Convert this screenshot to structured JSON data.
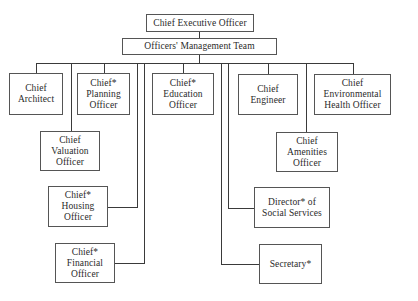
{
  "chart": {
    "top": {
      "ceo": [
        "Chief Executive Officer"
      ],
      "omt": [
        "Officers' Management Team"
      ]
    },
    "nodes": {
      "architect": [
        "Chief",
        "Architect"
      ],
      "planning": [
        "Chief*",
        "Planning",
        "Officer"
      ],
      "education": [
        "Chief*",
        "Education",
        "Officer"
      ],
      "engineer": [
        "Chief",
        "Engineer"
      ],
      "environmental": [
        "Chief",
        "Environmental",
        "Health Officer"
      ],
      "valuation": [
        "Chief",
        "Valuation",
        "Officer"
      ],
      "amenities": [
        "Chief",
        "Amenities",
        "Officer"
      ],
      "housing": [
        "Chief*",
        "Housing",
        "Officer"
      ],
      "social": [
        "Director* of",
        "Social Services"
      ],
      "financial": [
        "Chief*",
        "Financial",
        "Officer"
      ],
      "secretary": [
        "Secretary*"
      ]
    }
  }
}
